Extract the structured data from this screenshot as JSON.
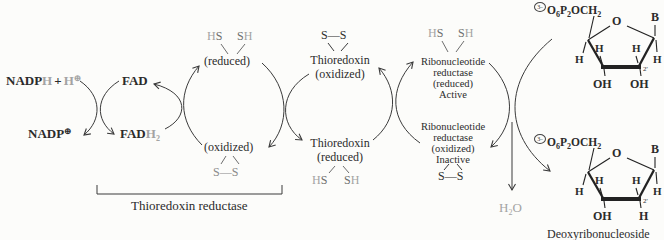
{
  "species": {
    "nadph": {
      "base": "NADP",
      "h": "H",
      "plus": "+",
      "h2": "H",
      "charge": "⊕"
    },
    "nadp": {
      "base": "NADP",
      "charge": "⊕"
    },
    "fad": {
      "base": "FAD"
    },
    "fadh2": {
      "base": "FAD",
      "h": "H",
      "sub": "2"
    },
    "water": {
      "h": "H",
      "sub": "2",
      "o": "O"
    }
  },
  "atoms": {
    "h": "H",
    "s": "S",
    "ss": "S—S",
    "oh": "OH",
    "o": "O",
    "b": "B",
    "two_prime": "2'"
  },
  "trx_reductase": {
    "reduced_label": "(reduced)",
    "oxidized_label": "(oxidized)",
    "bracket_label": "Thioredoxin reductase"
  },
  "thioredoxin": {
    "name": "Thioredoxin",
    "oxidized_label": "(oxidized)",
    "reduced_label": "(reduced)"
  },
  "rnr": {
    "name_line1": "Ribonucleotide",
    "name_line2": "reductase",
    "reduced_label": "(reduced)",
    "active_label": "Active",
    "oxidized_label": "(oxidized)",
    "inactive_label": "Inactive"
  },
  "sugar_formula": {
    "charge": "3−",
    "o": "O",
    "o_sub": "6",
    "p": "P",
    "p_sub": "2",
    "och": "OCH",
    "och_sub": "2"
  },
  "deoxy_caption": "Deoxyribonucleoside",
  "colors": {
    "ink": "#2b2b2b",
    "gray": "#a3a3a3",
    "arrow": "#3a3a3a"
  }
}
